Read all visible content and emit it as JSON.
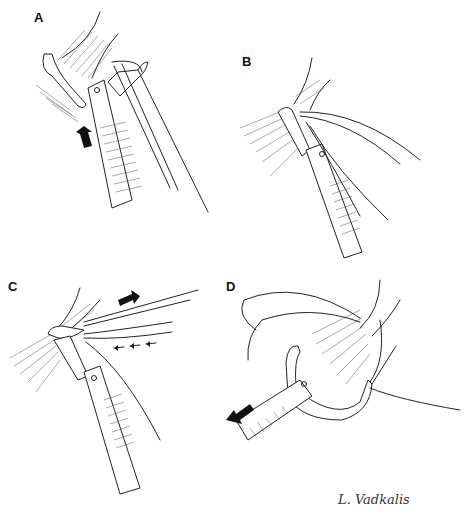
{
  "figure": {
    "type": "surgical-illustration",
    "panels": [
      {
        "id": "A",
        "label": "A",
        "description": "Suture passer jaw engaging tissue, arrow pushing upward"
      },
      {
        "id": "B",
        "label": "B",
        "description": "Jaws closed through tissue with suture loops"
      },
      {
        "id": "C",
        "label": "C",
        "description": "Suture limbs pulled; arrows indicating direction"
      },
      {
        "id": "D",
        "label": "D",
        "description": "Instrument withdrawn with suture passed, arrow pointing out"
      }
    ],
    "signature": "L. Vadkalis",
    "colors": {
      "ink": "#222222",
      "background": "#ffffff"
    }
  }
}
